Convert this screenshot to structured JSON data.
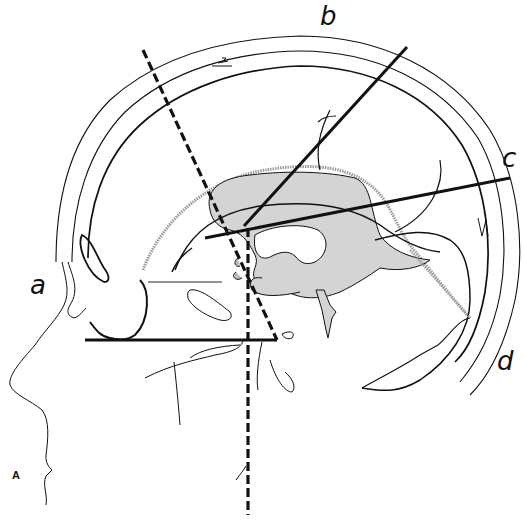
{
  "figure": {
    "panel_label": "A",
    "line_labels": {
      "a": "a",
      "b": "b",
      "c": "c",
      "d": "d"
    },
    "colors": {
      "ink": "#111111",
      "ventricle_fill": "#d4d4d4",
      "brain_outline_stipple": "#9a9a9a",
      "background": "#ffffff"
    }
  }
}
